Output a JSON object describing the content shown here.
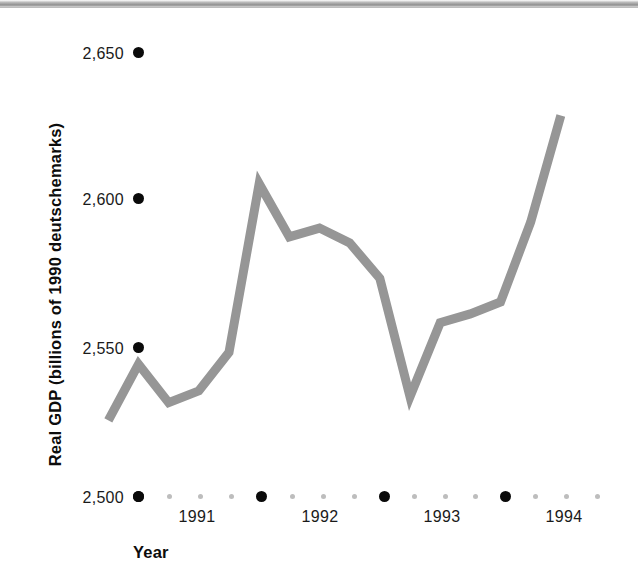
{
  "chart_data": {
    "type": "line",
    "title": "",
    "xlabel": "Year",
    "ylabel": "Real GDP (billions of 1990 deutschemarks)",
    "ylim": [
      2500,
      2650
    ],
    "y_ticks": [
      "2,500",
      "2,550",
      "2,600",
      "2,650"
    ],
    "y_tick_values": [
      2500,
      2550,
      2600,
      2650
    ],
    "x_ticks": [
      "1991",
      "1992",
      "1993",
      "1994"
    ],
    "x_tick_values": [
      1991,
      1992,
      1993,
      1994
    ],
    "grid": false,
    "legend": "none",
    "series": [
      {
        "name": "Real GDP",
        "color": "#969696",
        "x": [
          1990.75,
          1991.0,
          1991.25,
          1991.5,
          1991.75,
          1992.0,
          1992.25,
          1992.5,
          1992.75,
          1993.0,
          1993.25,
          1993.5,
          1993.75,
          1994.0,
          1994.25,
          1994.5
        ],
        "values": [
          2524,
          2543,
          2530,
          2534,
          2547,
          2604,
          2586,
          2589,
          2584,
          2572,
          2532,
          2557,
          2560,
          2564,
          2591,
          2627
        ]
      }
    ],
    "axis_marker_style": "dots",
    "major_dot_color": "#0a0a0a",
    "minor_dot_color": "#bdbdbd"
  },
  "axes": {
    "y_title": "Real GDP (billions of 1990 deutschemarks)",
    "x_title": "Year",
    "y_labels": [
      {
        "text": "2,650",
        "value": 2650
      },
      {
        "text": "2,600",
        "value": 2600
      },
      {
        "text": "2,550",
        "value": 2550
      },
      {
        "text": "2,500",
        "value": 2500
      }
    ],
    "x_labels": [
      {
        "text": "1991",
        "value": 1991
      },
      {
        "text": "1992",
        "value": 1992
      },
      {
        "text": "1993",
        "value": 1993
      },
      {
        "text": "1994",
        "value": 1994
      }
    ]
  }
}
